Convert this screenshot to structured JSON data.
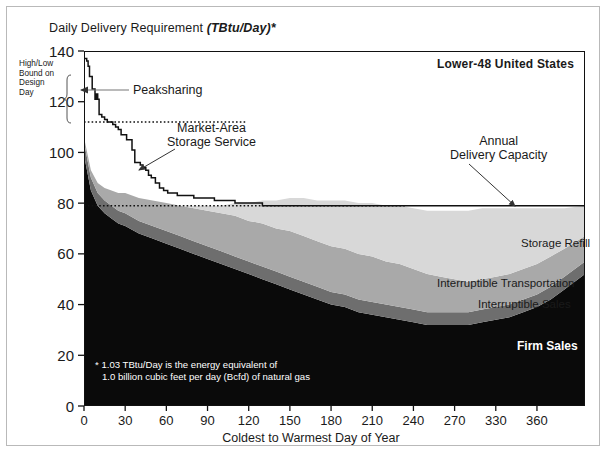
{
  "chart_data": {
    "type": "area",
    "title": "Daily Delivery Requirement (TBtu/Day)*",
    "title_plain": "Daily Delivery Requirement",
    "title_italic": "(TBtu/Day)*",
    "region_label": "Lower-48 United States",
    "xlabel": "Coldest to Warmest Day of Year",
    "ylabel": "Daily Delivery Requirement (TBtu/Day)*",
    "xlim": [
      0,
      365
    ],
    "ylim": [
      0,
      140
    ],
    "grid": false,
    "legend_position": "on-plot-right",
    "xticks": [
      0,
      30,
      60,
      90,
      120,
      150,
      180,
      210,
      240,
      270,
      330,
      360
    ],
    "xtick_positions": [
      0,
      30,
      60,
      90,
      120,
      150,
      180,
      210,
      240,
      270,
      300,
      330
    ],
    "yticks": [
      0,
      20,
      40,
      60,
      80,
      100,
      120,
      140
    ],
    "x": [
      0,
      5,
      10,
      15,
      20,
      25,
      30,
      40,
      50,
      60,
      70,
      80,
      90,
      100,
      110,
      120,
      130,
      140,
      150,
      160,
      170,
      180,
      190,
      200,
      210,
      220,
      230,
      240,
      250,
      260,
      270,
      280,
      290,
      300,
      310,
      320,
      330,
      340,
      350,
      365
    ],
    "series": [
      {
        "name": "Firm Sales",
        "color": "#0a0a0a",
        "text_color": "#ffffff",
        "values": [
          99,
          85,
          79,
          76,
          74,
          72,
          71,
          68,
          66,
          64,
          62,
          60,
          58,
          56,
          54,
          52,
          50,
          48,
          46,
          44,
          42,
          40,
          39,
          37,
          36,
          35,
          34,
          33,
          32,
          32,
          32,
          32,
          33,
          34,
          35,
          37,
          39,
          42,
          46,
          52
        ]
      },
      {
        "name": "Interruptible Sales",
        "color": "#6e6e6e",
        "text_color": "#111111",
        "values": [
          5,
          5,
          5,
          5,
          5,
          5,
          5,
          5,
          5,
          5,
          5,
          5,
          5,
          5,
          5,
          5,
          5,
          5,
          5,
          5,
          5,
          5,
          5,
          5,
          5,
          5,
          5,
          5,
          5,
          5,
          5,
          5,
          5,
          5,
          5,
          5,
          5,
          5,
          5,
          5
        ]
      },
      {
        "name": "Interruptible Transportation",
        "color": "#a9a9a9",
        "text_color": "#111111",
        "values": [
          2,
          3,
          4,
          5,
          6,
          7,
          8,
          9,
          10,
          11,
          12,
          13,
          14,
          15,
          16,
          16,
          17,
          17,
          18,
          18,
          18,
          18,
          18,
          18,
          18,
          17,
          17,
          16,
          15,
          14,
          13,
          12,
          12,
          12,
          12,
          12,
          12,
          12,
          11,
          10
        ]
      },
      {
        "name": "Storage Refill",
        "color": "#d8d8d8",
        "text_color": "#111111",
        "values": [
          0,
          0,
          0,
          0,
          0,
          0,
          0,
          0,
          0,
          0,
          0,
          1,
          2,
          3,
          5,
          7,
          9,
          11,
          13,
          15,
          16,
          18,
          19,
          20,
          21,
          22,
          23,
          24,
          25,
          26,
          27,
          28,
          28,
          27,
          26,
          24,
          22,
          19,
          16,
          12
        ]
      }
    ],
    "peak_curve": {
      "name": "Daily requirement curve",
      "color": "#111111",
      "x": [
        0,
        2,
        3,
        4,
        6,
        8,
        9,
        10,
        11,
        13,
        15,
        17,
        19,
        21,
        23,
        25,
        27,
        29,
        31,
        33,
        35,
        37,
        39,
        41,
        43,
        45,
        47,
        49,
        52,
        55,
        58,
        61,
        64,
        68,
        72,
        76,
        80,
        85,
        90,
        95,
        100,
        105,
        110,
        115,
        120,
        130,
        150,
        200,
        250,
        300,
        330,
        365
      ],
      "y": [
        137,
        136,
        134,
        130,
        125,
        121,
        123,
        121,
        115,
        114,
        113,
        112,
        112,
        111,
        110,
        109,
        107,
        107,
        105,
        105,
        101,
        96,
        96,
        95,
        94,
        93,
        91,
        90,
        88,
        86,
        85,
        84,
        84,
        83,
        83,
        83,
        82,
        82,
        82,
        81,
        81,
        81,
        80,
        80,
        80,
        79,
        79,
        79,
        79,
        79,
        79,
        79
      ]
    },
    "reference_lines": [
      {
        "name": "high-bound-design-day",
        "value": 112,
        "style": "dotted",
        "color": "#111111",
        "x_from": 0,
        "x_to": 118
      },
      {
        "name": "annual-delivery-capacity",
        "value": 79,
        "style": "dotted",
        "color": "#111111",
        "x_from": 0,
        "x_to": 235
      }
    ],
    "annotations": [
      {
        "name": "peaksharing",
        "label": "Peaksharing",
        "points_to": "design-day-bracket",
        "style": "leader-line"
      },
      {
        "name": "market-area-storage-service",
        "label_line1": "Market-Area",
        "label_line2": "Storage Service",
        "points_to": "curve",
        "style": "arrow"
      },
      {
        "name": "annual-delivery-capacity",
        "label_line1": "Annual",
        "label_line2": "Delivery Capacity",
        "points_to": "line-79",
        "style": "arrow"
      },
      {
        "name": "high-low-bound",
        "label_line1": "High/Low",
        "label_line2": "Bound on",
        "label_line3": "Design",
        "label_line4": "Day",
        "style": "bracket"
      }
    ],
    "footnote_line1": "* 1.03 TBtu/Day is the energy equivalent of",
    "footnote_line2": "1.0 billion cubic feet per day (Bcfd) of natural gas"
  }
}
